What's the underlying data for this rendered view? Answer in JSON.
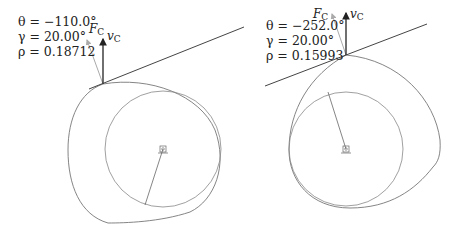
{
  "figures": [
    {
      "id": "left",
      "params": {
        "theta": "θ = −110.0°",
        "gamma": "γ = 20.00°",
        "rho": "ρ = 0.18712"
      },
      "labels": {
        "force": "F",
        "force_sub": "C",
        "velocity": "v",
        "velocity_sub": "C"
      }
    },
    {
      "id": "right",
      "params": {
        "theta": "θ = −252.0°",
        "gamma": "γ = 20.00°",
        "rho": "ρ = 0.15993"
      },
      "labels": {
        "force": "F",
        "force_sub": "C",
        "velocity": "v",
        "velocity_sub": "C"
      }
    }
  ],
  "colors": {
    "line": "#333333",
    "cam": "#777777",
    "force": "#aaaaaa"
  }
}
